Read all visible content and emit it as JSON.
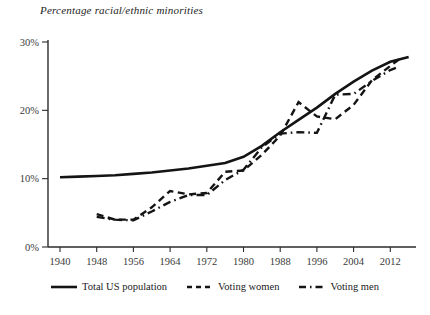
{
  "chart_data": {
    "type": "line",
    "title": "Percentage racial/ethnic minorities",
    "xlabel": "",
    "ylabel": "",
    "xlim": [
      1940,
      2016
    ],
    "ylim": [
      0,
      30
    ],
    "grid": false,
    "legend_position": "bottom-center",
    "x_ticks": [
      "1940",
      "1948",
      "1956",
      "1964",
      "1972",
      "1980",
      "1988",
      "1996",
      "2004",
      "2012"
    ],
    "y_ticks": [
      "0%",
      "10%",
      "20%",
      "30%"
    ],
    "y_tick_values": [
      0,
      10,
      20,
      30
    ],
    "x_tick_values": [
      1940,
      1948,
      1956,
      1964,
      1972,
      1980,
      1988,
      1996,
      2004,
      2012
    ],
    "series": [
      {
        "name": "Total US population",
        "style": "solid",
        "color": "#141414",
        "x": [
          1940,
          1944,
          1948,
          1952,
          1956,
          1960,
          1964,
          1968,
          1972,
          1976,
          1980,
          1984,
          1988,
          1992,
          1996,
          2000,
          2004,
          2008,
          2012,
          2016
        ],
        "values": [
          10.2,
          10.3,
          10.4,
          10.5,
          10.7,
          10.9,
          11.2,
          11.5,
          11.9,
          12.3,
          13.2,
          14.8,
          16.8,
          18.6,
          20.4,
          22.4,
          24.2,
          25.8,
          27.1,
          27.8
        ]
      },
      {
        "name": "Voting women",
        "style": "dashed",
        "color": "#141414",
        "x": [
          1948,
          1952,
          1956,
          1960,
          1964,
          1968,
          1972,
          1976,
          1980,
          1984,
          1988,
          1992,
          1996,
          2000,
          2004,
          2008,
          2012,
          2014
        ],
        "values": [
          4.8,
          4.0,
          4.0,
          5.8,
          8.2,
          7.7,
          7.9,
          11.0,
          11.2,
          13.5,
          16.3,
          21.2,
          19.1,
          18.7,
          20.8,
          24.4,
          26.5,
          27.5
        ]
      },
      {
        "name": "Voting men",
        "style": "dash-dot",
        "color": "#141414",
        "x": [
          1948,
          1952,
          1956,
          1960,
          1964,
          1968,
          1972,
          1976,
          1980,
          1984,
          1988,
          1992,
          1996,
          2000,
          2004,
          2008,
          2012,
          2014
        ],
        "values": [
          4.4,
          4.0,
          3.9,
          5.2,
          6.6,
          7.6,
          7.6,
          9.8,
          11.3,
          14.6,
          16.6,
          16.8,
          16.7,
          22.3,
          22.4,
          24.3,
          25.9,
          26.4
        ]
      }
    ]
  },
  "legend": {
    "items": [
      {
        "label": "Total US population",
        "style": "solid"
      },
      {
        "label": "Voting women",
        "style": "dashed"
      },
      {
        "label": "Voting men",
        "style": "dash-dot"
      }
    ]
  }
}
